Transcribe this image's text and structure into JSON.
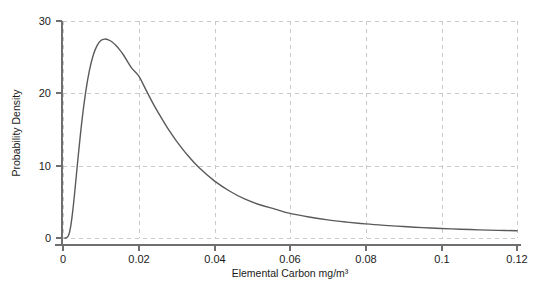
{
  "chart_data": {
    "type": "line",
    "title": "",
    "subtitle": "",
    "xlabel": "Elemental Carbon mg/m³",
    "ylabel": "Probability Density",
    "xlim": [
      0,
      0.12
    ],
    "ylim": [
      0,
      30
    ],
    "grid": true,
    "legend": "none",
    "xticks": [
      0,
      0.02,
      0.04,
      0.06,
      0.08,
      0.1,
      0.12
    ],
    "xtick_labels": [
      "0",
      "0.02",
      "0.04",
      "0.06",
      "0.08",
      "0.1",
      "0.12"
    ],
    "yticks": [
      0,
      10,
      20,
      30
    ],
    "ytick_labels": [
      "0",
      "10",
      "20",
      "30"
    ],
    "series": [
      {
        "name": "Elemental Carbon probability density",
        "color": "#5a5a5a",
        "x": [
          0.0005,
          0.001,
          0.0015,
          0.002,
          0.0025,
          0.003,
          0.004,
          0.005,
          0.006,
          0.007,
          0.008,
          0.009,
          0.01,
          0.011,
          0.012,
          0.013,
          0.014,
          0.015,
          0.016,
          0.018,
          0.02,
          0.022,
          0.024,
          0.026,
          0.028,
          0.03,
          0.033,
          0.036,
          0.04,
          0.044,
          0.048,
          0.052,
          0.056,
          0.06,
          0.065,
          0.07,
          0.075,
          0.08,
          0.085,
          0.09,
          0.095,
          0.1,
          0.105,
          0.11,
          0.115,
          0.12
        ],
        "y": [
          0.0,
          0.05,
          0.4,
          1.5,
          3.4,
          5.8,
          11.2,
          16.2,
          20.2,
          23.2,
          25.3,
          26.6,
          27.3,
          27.5,
          27.4,
          27.1,
          26.6,
          26.0,
          25.3,
          23.6,
          22.4,
          20.4,
          18.4,
          16.6,
          14.9,
          13.4,
          11.4,
          9.7,
          7.9,
          6.5,
          5.4,
          4.6,
          4.0,
          3.4,
          2.9,
          2.5,
          2.2,
          1.95,
          1.75,
          1.58,
          1.44,
          1.32,
          1.22,
          1.13,
          1.06,
          1.0
        ]
      }
    ],
    "peak": {
      "x": 0.013,
      "y": 27.5
    }
  },
  "colors": {
    "curve": "#5a5a5a",
    "grid": "#c9c9c9",
    "axis": "#6f6f6f",
    "text": "#1a1a1a",
    "background": "#ffffff"
  }
}
